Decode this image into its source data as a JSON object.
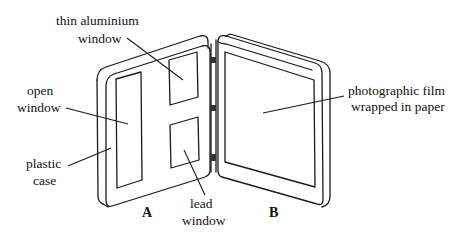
{
  "diagram": {
    "type": "labelled-apparatus-sketch",
    "panels": [
      {
        "id": "A",
        "label": "A"
      },
      {
        "id": "B",
        "label": "B"
      }
    ],
    "labels": {
      "thin_aluminium_window": [
        "thin aluminium",
        "window"
      ],
      "open_window": [
        "open",
        "window"
      ],
      "plastic_case": [
        "plastic",
        "case"
      ],
      "lead_window": [
        "lead",
        "window"
      ],
      "photographic_film": [
        "photographic film",
        "wrapped in paper"
      ]
    },
    "colors": {
      "ink": "#1a1a1a",
      "background": "#ffffff"
    }
  }
}
